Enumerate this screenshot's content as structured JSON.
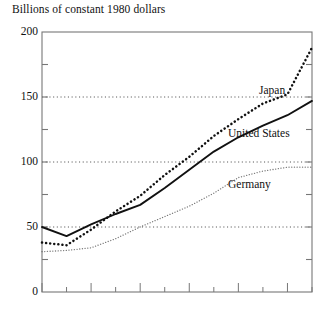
{
  "chart_data": {
    "type": "line",
    "title": "Billions of constant 1980 dollars",
    "xlabel": "",
    "ylabel": "Billions of constant 1980 dollars",
    "ylim": [
      0,
      200
    ],
    "yticks": [
      0,
      50,
      100,
      150,
      200
    ],
    "ytick_labels": [
      "0",
      "50",
      "100",
      "150",
      "200"
    ],
    "y_minor_ticks": [
      25,
      75,
      125,
      175
    ],
    "gridlines": [
      50,
      100,
      150
    ],
    "grid": "horizontal-dotted",
    "legend": "inline-labels",
    "x": [
      1,
      2,
      3,
      4,
      5,
      6,
      7,
      8,
      9,
      10,
      11,
      12
    ],
    "series": [
      {
        "name": "Japan",
        "style": "bold-dotted",
        "color": "#111111",
        "values": [
          38,
          36,
          48,
          62,
          74,
          90,
          104,
          120,
          133,
          145,
          152,
          188
        ]
      },
      {
        "name": "United States",
        "style": "solid",
        "color": "#111111",
        "values": [
          50,
          43,
          52,
          60,
          67,
          80,
          94,
          108,
          119,
          128,
          136,
          147
        ]
      },
      {
        "name": "Germany",
        "style": "fine-dotted",
        "color": "#555555",
        "values": [
          31,
          32,
          34,
          41,
          50,
          58,
          66,
          76,
          88,
          93,
          96,
          96
        ]
      }
    ],
    "annotations": [
      {
        "text": "Japan",
        "series": "Japan"
      },
      {
        "text": "United States",
        "series": "United States"
      },
      {
        "text": "Germany",
        "series": "Germany"
      }
    ]
  },
  "axis": {
    "tick_0": "0",
    "tick_50": "50",
    "tick_100": "100",
    "tick_150": "150",
    "tick_200": "200"
  },
  "labels": {
    "japan": "Japan",
    "united_states": "United States",
    "germany": "Germany"
  }
}
